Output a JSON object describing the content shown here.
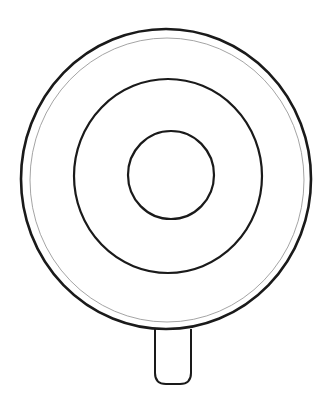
{
  "illustration": {
    "subject": "lollipop",
    "background_color": "#ffffff",
    "stroke_color": "#1a1a1a",
    "inner_rim_color": "#9a9a9a",
    "candy": {
      "outer_circle": {
        "cx": 166,
        "cy": 179,
        "rx": 145,
        "ry": 150,
        "stroke_width": 2.6
      },
      "rim_circle": {
        "cx": 167,
        "cy": 180,
        "rx": 137,
        "ry": 142,
        "stroke_width": 0.9
      },
      "middle_ring": {
        "cx": 168,
        "cy": 176,
        "rx": 94,
        "ry": 97,
        "stroke_width": 2.2
      },
      "inner_ring": {
        "cx": 171,
        "cy": 175,
        "rx": 43,
        "ry": 44,
        "stroke_width": 2.2
      }
    },
    "stick": {
      "x": 155,
      "y": 329,
      "width": 36,
      "height": 55,
      "bottom_radius": 11,
      "stroke_width": 2.0
    }
  }
}
